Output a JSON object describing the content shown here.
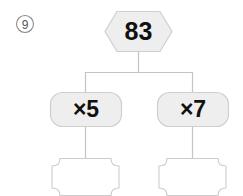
{
  "problem": {
    "marker_icon": "circled-number-icon",
    "marker_number": "9"
  },
  "diagram": {
    "type": "number-tree",
    "root": {
      "shape": "hexagon",
      "value": "83"
    },
    "branches": [
      {
        "operation_shape": "rounded-rect",
        "operation": "×5",
        "answer_shape": "notched-rect",
        "answer": ""
      },
      {
        "operation_shape": "rounded-rect",
        "operation": "×7",
        "answer_shape": "notched-rect",
        "answer": ""
      }
    ],
    "colors": {
      "node_fill": "#eeeeee",
      "node_stroke": "#cfcfcf",
      "blank_fill": "#ffffff",
      "blank_stroke": "#cccccc",
      "connector": "#c4c4c4",
      "text": "#111111",
      "marker": "#555555"
    }
  }
}
